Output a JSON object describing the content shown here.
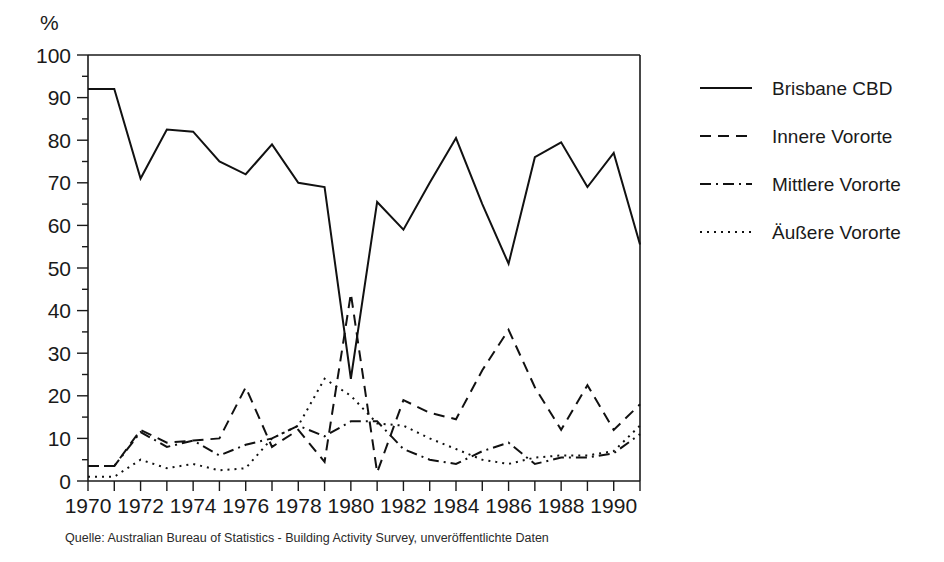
{
  "figure": {
    "yaxis_unit_label": "%",
    "source_note": "Quelle: Australian Bureau of Statistics - Building Activity Survey, unveröffentlichte Daten"
  },
  "legend": {
    "entries": [
      {
        "label": "Brisbane CBD",
        "dash": "solid"
      },
      {
        "label": "Innere Vororte",
        "dash": "dashed"
      },
      {
        "label": "Mittlere Vororte",
        "dash": "dash-dot"
      },
      {
        "label": "Äußere Vororte",
        "dash": "dotted"
      }
    ]
  },
  "chart_data": {
    "type": "line",
    "title": "",
    "subtitle": "",
    "xlabel": "",
    "ylabel": "%",
    "xlim": [
      1970,
      1991
    ],
    "ylim": [
      0,
      100
    ],
    "grid": false,
    "legend_position": "right",
    "y_ticks_major": [
      0,
      10,
      20,
      30,
      40,
      50,
      60,
      70,
      80,
      90,
      100
    ],
    "y_ticks_minor": [
      5,
      15,
      25,
      35,
      45,
      55,
      65,
      75,
      85,
      95
    ],
    "x_ticks_major": [
      1970,
      1972,
      1974,
      1976,
      1978,
      1980,
      1982,
      1984,
      1986,
      1988,
      1990
    ],
    "x_ticks_minor": [
      1971,
      1973,
      1975,
      1977,
      1979,
      1981,
      1983,
      1985,
      1987,
      1989,
      1991
    ],
    "x_tick_labels": [
      "1970",
      "1972",
      "1974",
      "1976",
      "1978",
      "1980",
      "1982",
      "1984",
      "1986",
      "1988",
      "1990"
    ],
    "x": [
      1970,
      1971,
      1972,
      1973,
      1974,
      1975,
      1976,
      1977,
      1978,
      1979,
      1980,
      1981,
      1982,
      1983,
      1984,
      1985,
      1986,
      1987,
      1988,
      1989,
      1990,
      1991
    ],
    "series": [
      {
        "name": "Brisbane CBD",
        "style": "solid",
        "values": [
          92,
          92,
          71,
          82.5,
          82,
          75,
          72,
          79,
          70,
          69,
          24,
          65.5,
          59,
          70,
          80.5,
          65,
          51,
          76,
          79.5,
          69,
          77,
          55.5
        ]
      },
      {
        "name": "Innere Vororte",
        "style": "dashed",
        "values": [
          3.5,
          3.5,
          12,
          9,
          9.5,
          10,
          22,
          8,
          12,
          4.5,
          44,
          2,
          19,
          16,
          14.5,
          26,
          35.5,
          22,
          12,
          22.5,
          12,
          18
        ]
      },
      {
        "name": "Mittlere Vororte",
        "style": "dash-dot",
        "values": [
          3.5,
          3.5,
          11.5,
          8,
          9.5,
          6,
          8.5,
          10,
          13,
          10.5,
          14,
          14,
          7.5,
          5,
          4,
          7,
          9,
          4,
          5.5,
          5.5,
          6.5,
          11
        ]
      },
      {
        "name": "Äußere Vororte",
        "style": "dotted",
        "values": [
          1,
          1,
          5,
          3,
          4,
          2.5,
          3,
          10,
          13,
          24,
          20,
          13.5,
          13,
          10,
          7.5,
          5,
          4,
          5.5,
          6,
          6,
          7,
          13
        ]
      }
    ]
  }
}
